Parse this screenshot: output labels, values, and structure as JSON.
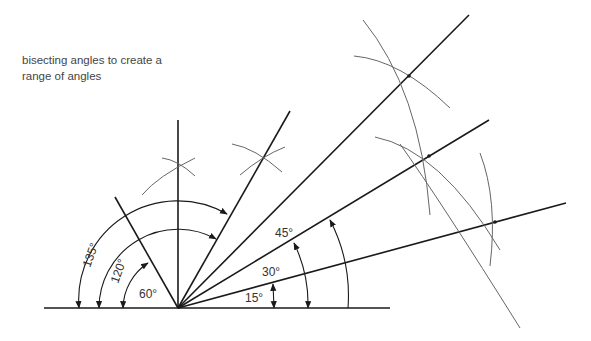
{
  "caption": {
    "line1": "bisecting angles to create a",
    "line2": "range of angles"
  },
  "labels": {
    "a135": "135°",
    "a120": "120°",
    "a60": "60°",
    "a45": "45°",
    "a30": "30°",
    "a15": "15°"
  },
  "colors": {
    "line": "#1a1a1a",
    "arc": "#666666",
    "text": "#444444"
  }
}
